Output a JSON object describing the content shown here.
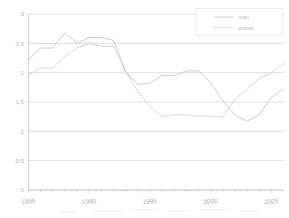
{
  "chart_data": {
    "type": "line",
    "title": "",
    "subtitle": "",
    "xlabel": "",
    "ylabel": "",
    "xlim": [
      1985,
      2006
    ],
    "ylim": [
      0,
      3
    ],
    "grid": true,
    "legend_position": "top-right",
    "y_ticks": [
      0,
      0.5,
      1,
      1.5,
      2,
      2.5,
      3
    ],
    "y_tick_labels": [
      "0",
      "0,5",
      "1",
      "1,5",
      "2",
      "2,5",
      "3"
    ],
    "x_ticks": [
      1985,
      1990,
      1995,
      2000,
      2005
    ],
    "x_tick_labels": [
      "1985",
      "1990",
      "1995",
      "2000",
      "2005"
    ],
    "x_minor_tick_step": 1,
    "x": [
      1985,
      1986,
      1987,
      1988,
      1989,
      1990,
      1991,
      1992,
      1993,
      1994,
      1995,
      1996,
      1997,
      1998,
      1999,
      2000,
      2001,
      2002,
      2003,
      2004,
      2005,
      2006
    ],
    "series": [
      {
        "name": "man",
        "style": "solid",
        "color": "#c2c2c2",
        "values": [
          2.22,
          2.42,
          2.42,
          2.68,
          2.5,
          2.6,
          2.6,
          2.55,
          2.02,
          1.8,
          1.82,
          1.95,
          1.95,
          2.03,
          2.03,
          1.83,
          1.52,
          1.28,
          1.17,
          1.28,
          1.58,
          1.72
        ]
      },
      {
        "name": "vrouw",
        "style": "dashed",
        "color": "#c2c2c2",
        "values": [
          1.97,
          2.08,
          2.08,
          2.28,
          2.42,
          2.5,
          2.45,
          2.45,
          2.02,
          1.68,
          1.42,
          1.25,
          1.28,
          1.28,
          1.26,
          1.26,
          1.24,
          1.55,
          1.72,
          1.9,
          2.0,
          2.15
        ]
      }
    ]
  },
  "legend": {
    "entries": [
      {
        "label": "man",
        "style": "solid"
      },
      {
        "label": "vrouw",
        "style": "dashed"
      }
    ]
  }
}
